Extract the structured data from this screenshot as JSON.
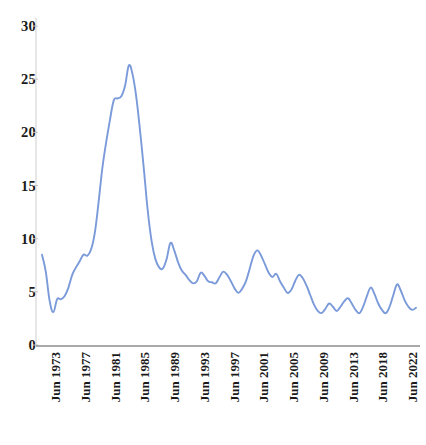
{
  "chart_data": {
    "type": "line",
    "title": "",
    "subtitle": "",
    "xlabel": "",
    "ylabel": "",
    "grid": false,
    "legend": false,
    "legend_position": "none",
    "line_color": "#7b9ada",
    "axis_color": "#9a9a9a",
    "ylim": [
      0,
      31.5
    ],
    "yticks": [
      0,
      5,
      10,
      15,
      20,
      25,
      30
    ],
    "ytick_labels": [
      "0",
      "5",
      "10",
      "15",
      "20",
      "25",
      "30"
    ],
    "xtick_labels": [
      "Jun 1973",
      "Jun 1977",
      "Jun 1981",
      "Jun 1985",
      "Jun 1989",
      "Jun 1993",
      "Jun 1997",
      "Jun 2001",
      "Jun 2005",
      "Jun 2009",
      "Jun 2013",
      "Jun 2018",
      "Jun 2022"
    ],
    "x_start_label": "Jun 1973",
    "x_end_label": "Jun 2022",
    "series": [
      {
        "name": "",
        "values": [
          8.5,
          6.9,
          4.2,
          3.1,
          4.3,
          4.3,
          4.6,
          5.4,
          6.6,
          7.3,
          7.9,
          8.5,
          8.4,
          9.0,
          10.6,
          13.5,
          16.7,
          19.1,
          21.2,
          23.0,
          23.2,
          23.4,
          24.4,
          26.3,
          25.4,
          23.2,
          20.0,
          16.4,
          12.6,
          9.8,
          8.1,
          7.3,
          7.2,
          8.1,
          9.6,
          8.9,
          7.8,
          7.0,
          6.6,
          6.1,
          5.8,
          6.0,
          6.8,
          6.5,
          6.0,
          5.9,
          5.8,
          6.4,
          6.9,
          6.6,
          6.0,
          5.3,
          4.9,
          5.3,
          6.0,
          7.2,
          8.4,
          8.9,
          8.4,
          7.6,
          6.8,
          6.4,
          6.7,
          6.0,
          5.4,
          4.9,
          5.2,
          6.0,
          6.6,
          6.3,
          5.6,
          4.7,
          3.8,
          3.2,
          3.0,
          3.4,
          3.9,
          3.6,
          3.2,
          3.6,
          4.1,
          4.4,
          3.9,
          3.3,
          3.0,
          3.6,
          4.6,
          5.4,
          4.8,
          3.9,
          3.3,
          3.0,
          3.6,
          4.7,
          5.7,
          5.1,
          4.2,
          3.6,
          3.3,
          3.5
        ]
      }
    ]
  }
}
